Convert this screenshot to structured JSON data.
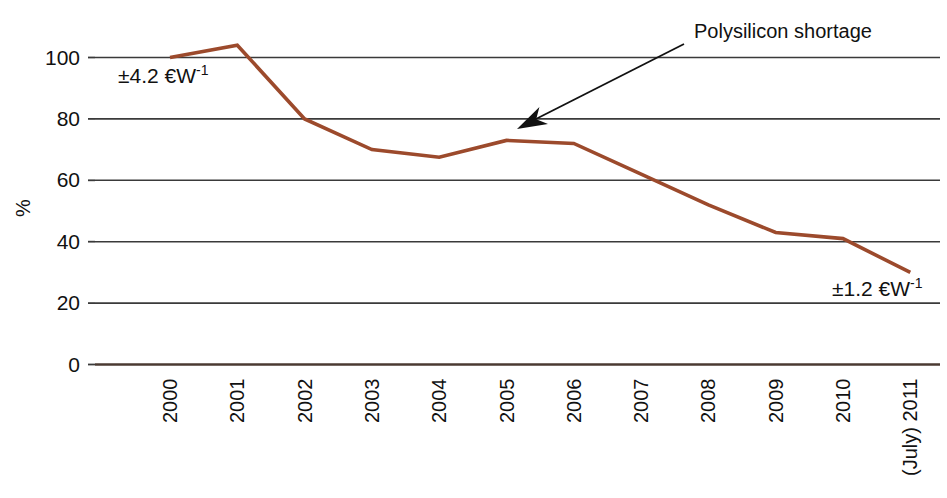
{
  "chart_data": {
    "type": "line",
    "title": "",
    "subtitle": "",
    "xlabel": "",
    "ylabel": "%",
    "ylim": [
      0,
      110
    ],
    "yticks": [
      0,
      20,
      40,
      60,
      80,
      100
    ],
    "ytick_labels": [
      "0",
      "20",
      "40",
      "60",
      "80",
      "100"
    ],
    "grid": true,
    "grid_axis": "y",
    "legend": false,
    "legend_position": "none",
    "categories": [
      "2000",
      "2001",
      "2002",
      "2003",
      "2004",
      "2005",
      "2006",
      "2007",
      "2008",
      "2009",
      "2010",
      "(July) 2011"
    ],
    "xtick_labels": [
      "2000",
      "2001",
      "2002",
      "2003",
      "2004",
      "2005",
      "2006",
      "2007",
      "2008",
      "2009",
      "2010",
      "(July) 2011"
    ],
    "xtick_rotation": 90,
    "series": [
      {
        "name": "PV module price index",
        "color": "#9c4a2c",
        "values": [
          100,
          104,
          80,
          70,
          67.5,
          73,
          72,
          62,
          52,
          43,
          41,
          30
        ]
      }
    ],
    "annotations": [
      {
        "id": "polysilicon-shortage",
        "text": "Polysilicon shortage",
        "text_x": 694,
        "text_y": 38,
        "arrow_from_x": 684,
        "arrow_from_y": 44,
        "arrow_to_x": 517,
        "arrow_to_y": 129
      },
      {
        "id": "price-start",
        "text": "±4.2 €W",
        "exponent": "-1",
        "x": 118,
        "y": 83
      },
      {
        "id": "price-end",
        "text": "±1.2 €W",
        "exponent": "-1",
        "x": 832,
        "y": 296
      }
    ]
  },
  "axes": {
    "y_axis_title": "%",
    "y_axis_title_rotation": -90
  },
  "colors": {
    "series_line": "#9c4a2c",
    "gridline": "#3a3a3a",
    "baseline": "#4a3a32",
    "text": "#111111",
    "background": "#ffffff"
  }
}
